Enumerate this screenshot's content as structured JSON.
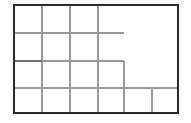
{
  "canvas": {
    "width": 191,
    "height": 123,
    "background_color": "#ffffff"
  },
  "diagram": {
    "kind": "floor-plan-line-drawing",
    "title": "",
    "outer_border": {
      "name": "outer-rectangle",
      "x": 14,
      "y": 5,
      "width": 164,
      "height": 108,
      "stroke_color": "#2b2b2b",
      "stroke_width": 2.2,
      "fill": "none"
    },
    "interior_stroke_color": "#9a9a9a",
    "interior_stroke_width": 1.2,
    "accent_stroke_color": "#6f6f6f",
    "accent_stroke_width": 1.8,
    "vertical_lines": [
      {
        "name": "vline-col-1",
        "x": 42,
        "y1": 5,
        "y2": 113,
        "color": "#9a9a9a",
        "width": 1.2
      },
      {
        "name": "vline-col-2",
        "x": 70,
        "y1": 5,
        "y2": 113,
        "color": "#9a9a9a",
        "width": 1.2
      },
      {
        "name": "vline-col-3",
        "x": 98,
        "y1": 5,
        "y2": 113,
        "color": "#9a9a9a",
        "width": 1.2
      },
      {
        "name": "vline-col-4-step",
        "x": 124,
        "y1": 61,
        "y2": 113,
        "color": "#9a9a9a",
        "width": 1.4
      },
      {
        "name": "vline-col-5-short",
        "x": 152,
        "y1": 88,
        "y2": 113,
        "color": "#9a9a9a",
        "width": 1.2
      }
    ],
    "horizontal_lines": [
      {
        "name": "hline-row-1-partial",
        "y": 33,
        "x1": 14,
        "x2": 124,
        "color": "#9a9a9a",
        "width": 1.2
      },
      {
        "name": "hline-row-2-accent",
        "y": 61,
        "x1": 14,
        "x2": 42,
        "color": "#6f6f6f",
        "width": 1.8
      },
      {
        "name": "hline-row-2-partial",
        "y": 61,
        "x1": 42,
        "x2": 124,
        "color": "#9a9a9a",
        "width": 1.2
      },
      {
        "name": "hline-row-3-full",
        "y": 88,
        "x1": 14,
        "x2": 178,
        "color": "#9a9a9a",
        "width": 1.2
      }
    ],
    "regions": [
      {
        "name": "region-top-left",
        "label": ""
      },
      {
        "name": "region-top-mid-a",
        "label": ""
      },
      {
        "name": "region-top-mid-b",
        "label": ""
      },
      {
        "name": "region-top-right-large",
        "label": ""
      },
      {
        "name": "region-middle-band",
        "label": ""
      },
      {
        "name": "region-step-right",
        "label": ""
      },
      {
        "name": "region-bottom-strip",
        "label": ""
      }
    ]
  }
}
